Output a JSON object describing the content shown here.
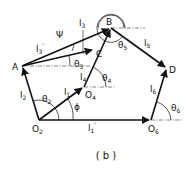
{
  "figure": {
    "caption": "( b )",
    "points": {
      "O2": {
        "label": "O",
        "sub": "2",
        "x": 39,
        "y": 120
      },
      "O6": {
        "label": "O",
        "sub": "6",
        "x": 151,
        "y": 120
      },
      "A": {
        "label": "A",
        "x": 22,
        "y": 66
      },
      "B": {
        "label": "B",
        "x": 111,
        "y": 28
      },
      "C": {
        "label": "C",
        "x": 94,
        "y": 50
      },
      "O4": {
        "label": "O",
        "sub": "4",
        "x": 84,
        "y": 87
      },
      "D": {
        "label": "D",
        "x": 167,
        "y": 68
      }
    },
    "links": {
      "l1": {
        "label": "l",
        "sub": "1"
      },
      "l1p": {
        "label": "l",
        "sub": "1",
        "prime": "'"
      },
      "l2": {
        "label": "l",
        "sub": "2"
      },
      "l3": {
        "label": "l",
        "sub": "3"
      },
      "l3p": {
        "label": "l",
        "sub": "3",
        "prime": "'"
      },
      "l4": {
        "label": "l",
        "sub": "4"
      },
      "l5": {
        "label": "l",
        "sub": "5"
      },
      "l6": {
        "label": "l",
        "sub": "6"
      }
    },
    "angles": {
      "theta2": {
        "label": "θ",
        "sub": "2"
      },
      "theta3": {
        "label": "θ",
        "sub": "3"
      },
      "theta4": {
        "label": "θ",
        "sub": "4"
      },
      "theta5": {
        "label": "θ",
        "sub": "5"
      },
      "theta6": {
        "label": "θ",
        "sub": "6"
      },
      "phi": {
        "label": "ϕ"
      },
      "psi": {
        "label": "Ψ"
      }
    }
  }
}
